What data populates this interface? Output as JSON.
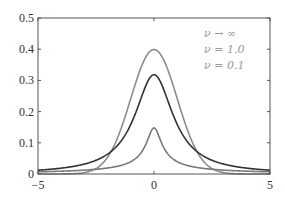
{
  "chart_data": {
    "type": "line",
    "title": "",
    "xlabel": "",
    "ylabel": "",
    "xlim": [
      -5,
      5
    ],
    "ylim": [
      0,
      0.5
    ],
    "grid": false,
    "legend_position": "top-right",
    "x_ticks": [
      -5,
      0,
      5
    ],
    "x_tick_labels": [
      "−5",
      "0",
      "5"
    ],
    "y_ticks": [
      0,
      0.1,
      0.2,
      0.3,
      0.4,
      0.5
    ],
    "y_tick_labels": [
      "0",
      "0.1",
      "0.2",
      "0.3",
      "0.4",
      "0.5"
    ],
    "distribution": "Student's t (mu=0, lambda=1)",
    "series": [
      {
        "name": "ν → ∞",
        "nu": "infinity",
        "color": "#8c8c8c",
        "x": [
          -5,
          -4,
          -3,
          -2.5,
          -2,
          -1.5,
          -1,
          -0.5,
          0,
          0.5,
          1,
          1.5,
          2,
          2.5,
          3,
          4,
          5
        ],
        "y": [
          0.0,
          0.0001,
          0.0044,
          0.0175,
          0.054,
          0.1295,
          0.242,
          0.3521,
          0.3989,
          0.3521,
          0.242,
          0.1295,
          0.054,
          0.0175,
          0.0044,
          0.0001,
          0.0
        ]
      },
      {
        "name": "ν = 1.0",
        "nu": 1.0,
        "color": "#333333",
        "x": [
          -5,
          -4,
          -3,
          -2.5,
          -2,
          -1.5,
          -1,
          -0.5,
          0,
          0.5,
          1,
          1.5,
          2,
          2.5,
          3,
          4,
          5
        ],
        "y": [
          0.0122,
          0.0187,
          0.0318,
          0.0439,
          0.0637,
          0.0979,
          0.1592,
          0.2546,
          0.3183,
          0.2546,
          0.1592,
          0.0979,
          0.0637,
          0.0439,
          0.0318,
          0.0187,
          0.0122
        ]
      },
      {
        "name": "ν = 0.1",
        "nu": 0.1,
        "color": "#7a7a7a",
        "x": [
          -5,
          -4,
          -3,
          -2,
          -1,
          -0.5,
          0,
          0.5,
          1,
          2,
          3,
          4,
          5
        ],
        "y": [
          0.0095,
          0.0119,
          0.016,
          0.0244,
          0.0491,
          0.0914,
          0.148,
          0.0914,
          0.0491,
          0.0244,
          0.016,
          0.0119,
          0.0095
        ]
      }
    ],
    "legend": [
      "ν → ∞",
      "ν = 1.0",
      "ν = 0.1"
    ]
  }
}
